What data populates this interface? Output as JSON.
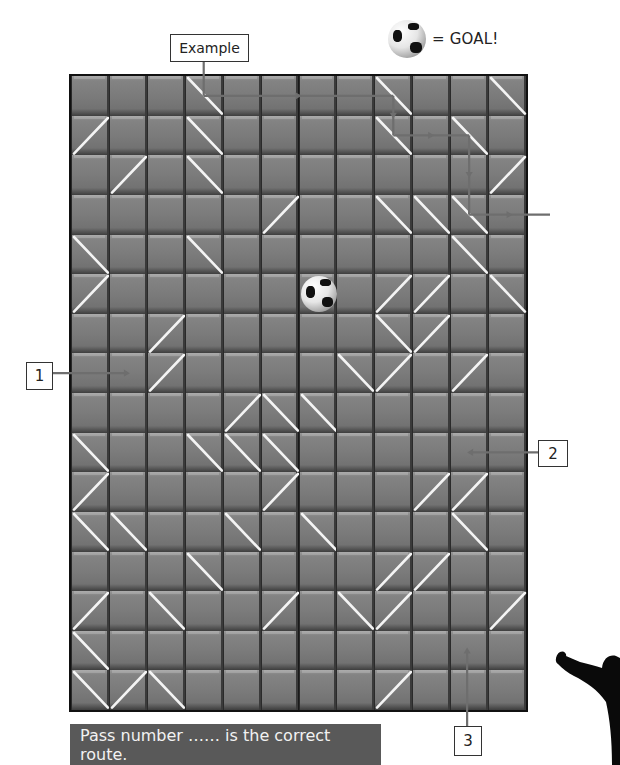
{
  "legend": {
    "icon": "soccer-ball-icon",
    "text": "= GOAL!"
  },
  "labels": {
    "example": "Example",
    "pass1": "1",
    "pass2": "2",
    "pass3": "3"
  },
  "banner": {
    "text": "Pass number …… is the correct route."
  },
  "board": {
    "rows": 16,
    "cols": 12,
    "goal": {
      "row": 5,
      "col": 6
    },
    "mirrors": [
      {
        "row": 0,
        "col": 3,
        "dir": "\\"
      },
      {
        "row": 0,
        "col": 8,
        "dir": "\\"
      },
      {
        "row": 0,
        "col": 11,
        "dir": "\\"
      },
      {
        "row": 1,
        "col": 0,
        "dir": "/"
      },
      {
        "row": 1,
        "col": 3,
        "dir": "\\"
      },
      {
        "row": 1,
        "col": 8,
        "dir": "\\"
      },
      {
        "row": 1,
        "col": 10,
        "dir": "\\"
      },
      {
        "row": 2,
        "col": 1,
        "dir": "/"
      },
      {
        "row": 2,
        "col": 3,
        "dir": "\\"
      },
      {
        "row": 2,
        "col": 11,
        "dir": "/"
      },
      {
        "row": 3,
        "col": 5,
        "dir": "/"
      },
      {
        "row": 3,
        "col": 8,
        "dir": "\\"
      },
      {
        "row": 3,
        "col": 9,
        "dir": "\\"
      },
      {
        "row": 3,
        "col": 10,
        "dir": "\\"
      },
      {
        "row": 4,
        "col": 0,
        "dir": "\\"
      },
      {
        "row": 4,
        "col": 3,
        "dir": "\\"
      },
      {
        "row": 4,
        "col": 10,
        "dir": "\\"
      },
      {
        "row": 5,
        "col": 0,
        "dir": "/"
      },
      {
        "row": 5,
        "col": 8,
        "dir": "/"
      },
      {
        "row": 5,
        "col": 9,
        "dir": "/"
      },
      {
        "row": 5,
        "col": 11,
        "dir": "\\"
      },
      {
        "row": 6,
        "col": 2,
        "dir": "/"
      },
      {
        "row": 6,
        "col": 8,
        "dir": "\\"
      },
      {
        "row": 6,
        "col": 9,
        "dir": "/"
      },
      {
        "row": 7,
        "col": 2,
        "dir": "/"
      },
      {
        "row": 7,
        "col": 7,
        "dir": "\\"
      },
      {
        "row": 7,
        "col": 8,
        "dir": "/"
      },
      {
        "row": 7,
        "col": 10,
        "dir": "/"
      },
      {
        "row": 8,
        "col": 4,
        "dir": "/"
      },
      {
        "row": 8,
        "col": 5,
        "dir": "\\"
      },
      {
        "row": 8,
        "col": 6,
        "dir": "\\"
      },
      {
        "row": 9,
        "col": 0,
        "dir": "\\"
      },
      {
        "row": 9,
        "col": 3,
        "dir": "\\"
      },
      {
        "row": 9,
        "col": 4,
        "dir": "\\"
      },
      {
        "row": 9,
        "col": 5,
        "dir": "\\"
      },
      {
        "row": 10,
        "col": 0,
        "dir": "/"
      },
      {
        "row": 10,
        "col": 5,
        "dir": "/"
      },
      {
        "row": 10,
        "col": 9,
        "dir": "/"
      },
      {
        "row": 10,
        "col": 10,
        "dir": "/"
      },
      {
        "row": 11,
        "col": 0,
        "dir": "\\"
      },
      {
        "row": 11,
        "col": 1,
        "dir": "\\"
      },
      {
        "row": 11,
        "col": 4,
        "dir": "\\"
      },
      {
        "row": 11,
        "col": 6,
        "dir": "\\"
      },
      {
        "row": 11,
        "col": 10,
        "dir": "\\"
      },
      {
        "row": 12,
        "col": 3,
        "dir": "\\"
      },
      {
        "row": 12,
        "col": 8,
        "dir": "/"
      },
      {
        "row": 12,
        "col": 9,
        "dir": "/"
      },
      {
        "row": 13,
        "col": 0,
        "dir": "/"
      },
      {
        "row": 13,
        "col": 2,
        "dir": "\\"
      },
      {
        "row": 13,
        "col": 5,
        "dir": "/"
      },
      {
        "row": 13,
        "col": 7,
        "dir": "\\"
      },
      {
        "row": 13,
        "col": 8,
        "dir": "/"
      },
      {
        "row": 13,
        "col": 11,
        "dir": "/"
      },
      {
        "row": 14,
        "col": 0,
        "dir": "\\"
      },
      {
        "row": 15,
        "col": 0,
        "dir": "\\"
      },
      {
        "row": 15,
        "col": 1,
        "dir": "/"
      },
      {
        "row": 15,
        "col": 2,
        "dir": "\\"
      },
      {
        "row": 15,
        "col": 8,
        "dir": "/"
      }
    ],
    "example_path": [
      {
        "row": -1,
        "col": 3
      },
      {
        "row": 0,
        "col": 3
      },
      {
        "row": 0,
        "col": 8
      },
      {
        "row": 1,
        "col": 8
      },
      {
        "row": 1,
        "col": 10
      },
      {
        "row": 3,
        "col": 10
      },
      {
        "row": 3,
        "col": 12.6
      }
    ],
    "passes": [
      {
        "label": "1",
        "entry": "left",
        "row": 7,
        "col": 1
      },
      {
        "label": "2",
        "entry": "right",
        "row": 9,
        "col": 10
      },
      {
        "label": "3",
        "entry": "bottom",
        "row": 14,
        "col": 10
      }
    ]
  },
  "colors": {
    "cell": "#7b7b7b",
    "mirror": "#f4f4f4",
    "path": "#6e6e6e",
    "banner": "#595959"
  }
}
